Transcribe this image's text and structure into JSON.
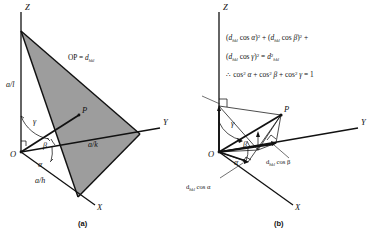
{
  "figure": {
    "title_hidden": "Interplanar spacing direction cosines construction",
    "panels": [
      {
        "id": "a",
        "caption": "(a)",
        "axes": [
          {
            "name": "Z",
            "label": "Z"
          },
          {
            "name": "Y",
            "label": "Y"
          },
          {
            "name": "X",
            "label": "X"
          }
        ],
        "origin_label": "O",
        "point_label": "P",
        "intercepts": [
          {
            "axis": "Z",
            "label": "a/l"
          },
          {
            "axis": "Y",
            "label": "a/k"
          },
          {
            "axis": "X",
            "label": "a/h"
          }
        ],
        "angles": [
          {
            "name": "alpha",
            "label": "α"
          },
          {
            "name": "beta",
            "label": "β"
          },
          {
            "name": "gamma",
            "label": "γ"
          }
        ],
        "annotation": {
          "prefix": "OP = ",
          "symbol": "d",
          "subscript": "hkl"
        },
        "plane_shaded": true
      },
      {
        "id": "b",
        "caption": "(b)",
        "axes": [
          {
            "name": "Z",
            "label": "Z"
          },
          {
            "name": "Y",
            "label": "Y"
          },
          {
            "name": "X",
            "label": "X"
          }
        ],
        "origin_label": "O",
        "point_label": "P",
        "angles": [
          {
            "name": "alpha",
            "label": "α"
          },
          {
            "name": "beta",
            "label": "β"
          },
          {
            "name": "gamma",
            "label": "γ"
          }
        ],
        "component_labels": [
          {
            "name": "d-cos-gamma",
            "symbol": "d",
            "subscript": "hkl",
            "text": " cos γ"
          },
          {
            "name": "d-cos-beta",
            "symbol": "d",
            "subscript": "hkl",
            "text": " cos β"
          },
          {
            "name": "d-cos-alpha",
            "symbol": "d",
            "subscript": "hkl",
            "text": " cos α"
          }
        ],
        "equations": {
          "line1": {
            "parts": [
              {
                "t": "("
              },
              {
                "t": "d",
                "style": "it"
              },
              {
                "t": "hkl",
                "style": "sub"
              },
              {
                "t": " cos "
              },
              {
                "t": "α",
                "style": "it"
              },
              {
                "t": ")"
              },
              {
                "t": "2",
                "style": "sup"
              },
              {
                "t": " + ("
              },
              {
                "t": "d",
                "style": "it"
              },
              {
                "t": "hkl",
                "style": "sub"
              },
              {
                "t": " cos "
              },
              {
                "t": "β",
                "style": "it"
              },
              {
                "t": ")"
              },
              {
                "t": "2",
                "style": "sup"
              },
              {
                "t": " +"
              }
            ],
            "plain": "(d_hkl cos α)² + (d_hkl cos β)² +"
          },
          "line2": {
            "plain": "(d_hkl cos γ)² = d²_hkl"
          },
          "line3": {
            "plain": "∴ cos² α + cos² β + cos² γ = 1"
          }
        }
      }
    ]
  },
  "colors": {
    "plane_gray": "#9d9d9d",
    "ink": "#111111",
    "background": "#ffffff"
  }
}
